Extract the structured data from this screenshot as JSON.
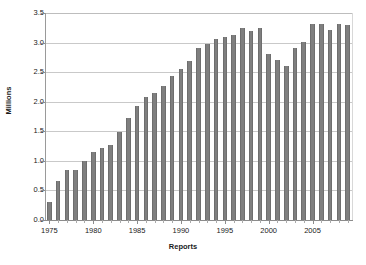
{
  "chart_data": {
    "type": "bar",
    "title": "",
    "xlabel": "Reports",
    "ylabel": "Millions",
    "grid": true,
    "legend": false,
    "ylim": [
      0.0,
      3.5
    ],
    "ytick_labels": [
      "0.0",
      "0.5",
      "1.0",
      "1.5",
      "2.0",
      "2.5",
      "3.0",
      "3.5"
    ],
    "ytick_values": [
      0.0,
      0.5,
      1.0,
      1.5,
      2.0,
      2.5,
      3.0,
      3.5
    ],
    "xtick_labels": [
      "1975",
      "1980",
      "1985",
      "1990",
      "1995",
      "2000",
      "2005"
    ],
    "xtick_values": [
      1975,
      1980,
      1985,
      1990,
      1995,
      2000,
      2005
    ],
    "xlim": [
      1974.5,
      2009.5
    ],
    "categories": [
      "1975",
      "1976",
      "1977",
      "1978",
      "1979",
      "1980",
      "1981",
      "1982",
      "1983",
      "1984",
      "1985",
      "1986",
      "1987",
      "1988",
      "1989",
      "1990",
      "1991",
      "1992",
      "1993",
      "1994",
      "1995",
      "1996",
      "1997",
      "1998",
      "1999",
      "2000",
      "2001",
      "2002",
      "2003",
      "2004",
      "2005",
      "2006",
      "2007",
      "2008",
      "2009"
    ],
    "values": [
      0.31,
      0.66,
      0.84,
      0.84,
      0.99,
      1.15,
      1.21,
      1.27,
      1.48,
      1.73,
      1.92,
      2.08,
      2.15,
      2.27,
      2.44,
      2.56,
      2.69,
      2.91,
      2.97,
      3.06,
      3.1,
      3.12,
      3.24,
      3.19,
      3.25,
      2.81,
      2.71,
      2.61,
      2.91,
      3.01,
      3.31,
      3.31,
      3.21,
      3.31,
      3.3
    ],
    "units": "Millions",
    "bar_color": "#7f7f7f",
    "grid_color": "#c9c9c9",
    "axis_color": "#8c8c8c",
    "background_color": "#ffffff"
  }
}
